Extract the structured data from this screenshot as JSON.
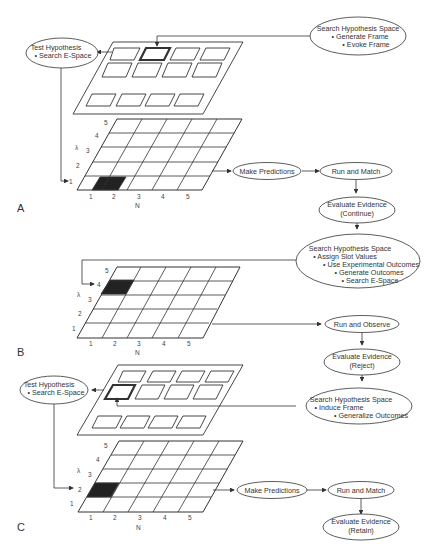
{
  "panels": [
    {
      "id": "A",
      "label": "A",
      "axis_x_label": "N",
      "axis_y_label": "λ",
      "x_ticks": [
        "1",
        "2",
        "3",
        "4",
        "5"
      ],
      "y_ticks": [
        "1",
        "2",
        "3",
        "4",
        "5"
      ],
      "shaded_cell": {
        "n": 2,
        "lambda": 1
      },
      "nodes": {
        "search_hypothesis": {
          "title": "Search Hypothesis Space",
          "bullets": [
            "• Generate Frame",
            "• Evoke Frame"
          ]
        },
        "test_hypothesis": {
          "title": "Test Hypothesis",
          "bullets": [
            "• Search E-Space"
          ]
        },
        "make_predictions": {
          "title": "Make Predictions"
        },
        "run_and_match": {
          "title": "Run and Match"
        },
        "evaluate_evidence": {
          "title": "Evaluate Evidence",
          "subtitle": "(Continue)"
        }
      }
    },
    {
      "id": "B",
      "label": "B",
      "axis_x_label": "N",
      "axis_y_label": "λ",
      "x_ticks": [
        "1",
        "2",
        "3",
        "4",
        "5"
      ],
      "y_ticks": [
        "1",
        "2",
        "3",
        "4",
        "5"
      ],
      "shaded_cell": {
        "n": 1,
        "lambda": 4
      },
      "nodes": {
        "search_hypothesis": {
          "title": "Search Hypothesis Space",
          "bullets": [
            "• Assign Slot Values",
            "• Use Experimental Outcomes",
            "• Generate Outcomes",
            "• Search E-Space"
          ]
        },
        "run_and_observe": {
          "title": "Run and Observe"
        },
        "evaluate_evidence": {
          "title": "Evaluate Evidence",
          "subtitle": "(Reject)"
        }
      }
    },
    {
      "id": "C",
      "label": "C",
      "axis_x_label": "N",
      "axis_y_label": "λ",
      "x_ticks": [
        "1",
        "2",
        "3",
        "4",
        "5"
      ],
      "y_ticks": [
        "1",
        "2",
        "3",
        "4",
        "5"
      ],
      "shaded_cell": {
        "n": 1,
        "lambda": 2
      },
      "nodes": {
        "search_hypothesis": {
          "title": "Search Hypothesis Space",
          "bullets": [
            "• Induce Frame",
            "• Generalize Outcomes"
          ]
        },
        "test_hypothesis": {
          "title": "Test Hypothesis",
          "bullets": [
            "• Search E-Space"
          ]
        },
        "make_predictions": {
          "title": "Make Predictions"
        },
        "run_and_match": {
          "title": "Run and Match"
        },
        "evaluate_evidence": {
          "title": "Evaluate Evidence",
          "subtitle": "(Retain)"
        }
      }
    }
  ],
  "colors": {
    "line": "#333333",
    "shade": "#222222",
    "text": "#333333"
  }
}
